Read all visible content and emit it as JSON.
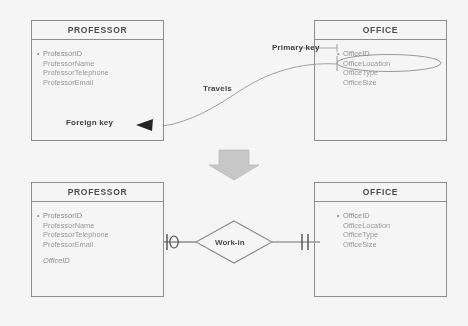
{
  "diagram": {
    "colors": {
      "line": "#8e8e8e",
      "text_faded": "#9a9a9a",
      "text_bold": "#3d3d3d",
      "arrow_fill": "#c9c9c9",
      "background": "#fdfdfd"
    }
  },
  "top": {
    "professor": {
      "title": "PROFESSOR",
      "attributes": [
        "ProfessorID",
        "ProfessorName",
        "ProfessorTelephone",
        "ProfessorEmail"
      ],
      "foreign_key_label": "Foreign key"
    },
    "office": {
      "title": "OFFICE",
      "attributes": [
        "OfficeID",
        "OfficeLocation",
        "OfficeType",
        "OfficeSize"
      ],
      "primary_key_label": "Primary key",
      "highlighted_attribute": "OfficeID"
    },
    "connector_label": "Travels"
  },
  "transition": {
    "arrow_icon": "down-block-arrow"
  },
  "bottom": {
    "professor": {
      "title": "PROFESSOR",
      "attributes": [
        "ProfessorID",
        "ProfessorName",
        "ProfessorTelephone",
        "ProfessorEmail"
      ],
      "foreign_key_attribute": "OfficeID"
    },
    "office": {
      "title": "OFFICE",
      "attributes": [
        "OfficeID",
        "OfficeLocation",
        "OfficeType",
        "OfficeSize"
      ]
    },
    "relationship": {
      "label": "Work-in",
      "left_cardinality": "zero-or-one",
      "right_cardinality": "one-and-only-one"
    }
  }
}
